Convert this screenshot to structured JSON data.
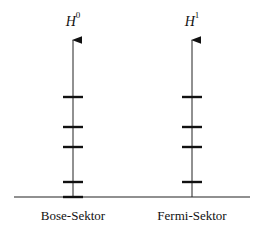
{
  "diagram": {
    "baseline": {
      "x1": 14,
      "x2": 250,
      "y": 197
    },
    "sectors": [
      {
        "name": "Bose-Sektor",
        "operator": "H",
        "superscript": "0",
        "axis_x": 73,
        "levels_y": [
          97,
          127,
          147,
          182,
          197
        ]
      },
      {
        "name": "Fermi-Sektor",
        "operator": "H",
        "superscript": "1",
        "axis_x": 192,
        "levels_y": [
          97,
          127,
          147,
          182
        ]
      }
    ]
  }
}
